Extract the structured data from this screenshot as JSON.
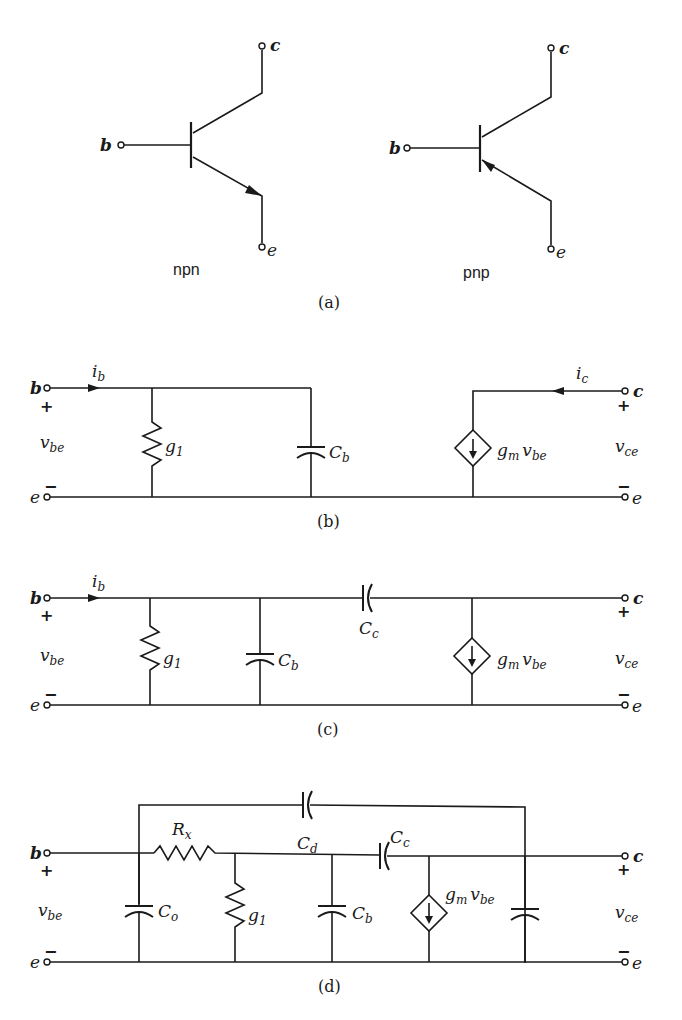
{
  "figure": {
    "panels": [
      {
        "id": "a",
        "caption": "(a)",
        "symbols": [
          {
            "name": "npn",
            "label": "npn",
            "terminals": {
              "base": "b",
              "collector": "c",
              "emitter": "e"
            },
            "emitter_arrow": "outward"
          },
          {
            "name": "pnp",
            "label": "pnp",
            "terminals": {
              "base": "b",
              "collector": "c",
              "emitter": "e"
            },
            "emitter_arrow": "inward"
          }
        ]
      },
      {
        "id": "b",
        "caption": "(b)",
        "input": {
          "top_terminal": "b",
          "bottom_terminal": "e",
          "voltage": "v",
          "voltage_sub": "be",
          "current": "i",
          "current_sub": "b",
          "plus": "+",
          "minus": "−"
        },
        "output": {
          "top_terminal": "c",
          "bottom_terminal": "e",
          "voltage": "v",
          "voltage_sub": "ce",
          "current": "i",
          "current_sub": "c",
          "plus": "+",
          "minus": "−"
        },
        "components": [
          {
            "type": "resistor",
            "label": "g",
            "sub": "1"
          },
          {
            "type": "capacitor",
            "label": "C",
            "sub": "b"
          },
          {
            "type": "dependent-current-source",
            "label": "g",
            "sub": "m",
            "label2": "v",
            "sub2": "be"
          }
        ]
      },
      {
        "id": "c",
        "caption": "(c)",
        "input": {
          "top_terminal": "b",
          "bottom_terminal": "e",
          "voltage": "v",
          "voltage_sub": "be",
          "current": "i",
          "current_sub": "b",
          "plus": "+",
          "minus": "−"
        },
        "output": {
          "top_terminal": "c",
          "bottom_terminal": "e",
          "voltage": "v",
          "voltage_sub": "ce",
          "plus": "+",
          "minus": "−"
        },
        "components": [
          {
            "type": "resistor",
            "label": "g",
            "sub": "1"
          },
          {
            "type": "capacitor",
            "label": "C",
            "sub": "b"
          },
          {
            "type": "capacitor",
            "label": "C",
            "sub": "c"
          },
          {
            "type": "dependent-current-source",
            "label": "g",
            "sub": "m",
            "label2": "v",
            "sub2": "be"
          }
        ]
      },
      {
        "id": "d",
        "caption": "(d)",
        "input": {
          "top_terminal": "b",
          "bottom_terminal": "e",
          "voltage": "v",
          "voltage_sub": "be",
          "plus": "+",
          "minus": "−"
        },
        "output": {
          "top_terminal": "c",
          "bottom_terminal": "e",
          "voltage": "v",
          "voltage_sub": "ce",
          "plus": "+",
          "minus": "−"
        },
        "components": [
          {
            "type": "resistor",
            "label": "R",
            "sub": "x"
          },
          {
            "type": "capacitor",
            "label": "C",
            "sub": "d"
          },
          {
            "type": "capacitor",
            "label": "C",
            "sub": "c"
          },
          {
            "type": "capacitor",
            "label": "C",
            "sub": "o"
          },
          {
            "type": "resistor",
            "label": "g",
            "sub": "1"
          },
          {
            "type": "capacitor",
            "label": "C",
            "sub": "b"
          },
          {
            "type": "dependent-current-source",
            "label": "g",
            "sub": "m",
            "label2": "v",
            "sub2": "be"
          },
          {
            "type": "capacitor",
            "label": "",
            "sub": ""
          }
        ]
      }
    ]
  }
}
